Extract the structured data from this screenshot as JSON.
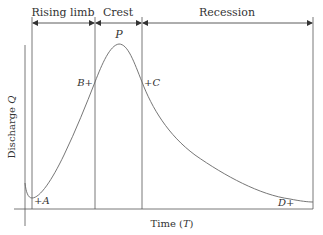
{
  "diagram": {
    "segments": [
      {
        "label": "Rising limb"
      },
      {
        "label": "Crest"
      },
      {
        "label": "Recession"
      }
    ],
    "axes": {
      "y_label_text": "Discharge ",
      "y_label_var": "Q",
      "x_label_text": "Time (",
      "x_label_var": "T",
      "x_label_close": ")"
    },
    "points": {
      "peak": "P",
      "a": "+A",
      "b": "B+",
      "c": "+C",
      "d": "D+"
    },
    "colors": {
      "line": "#555555",
      "curve": "#666666",
      "text": "#333333"
    }
  }
}
